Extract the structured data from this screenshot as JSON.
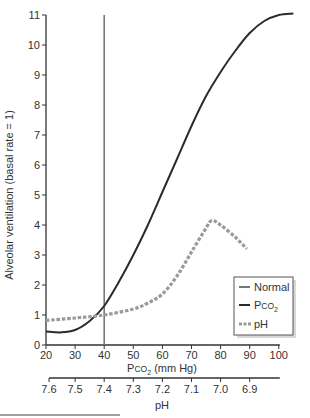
{
  "chart_data": {
    "type": "line",
    "title": "",
    "ylabel": "Alveolar ventilation (basal rate = 1)",
    "xlabel": "Pco2 (mm Hg)",
    "xlabel_parts": {
      "main": "P",
      "sub_small": "CO",
      "subscript": "2",
      "unit": " (mm Hg)"
    },
    "x2label": "pH",
    "xlim": [
      20,
      106
    ],
    "ylim": [
      0,
      11
    ],
    "x_ticks": [
      20,
      30,
      40,
      50,
      60,
      70,
      80,
      90,
      100
    ],
    "y_ticks": [
      0,
      1,
      2,
      3,
      4,
      5,
      6,
      7,
      8,
      9,
      10,
      11
    ],
    "ph_ticks": [
      {
        "label": "7.6",
        "x": 20
      },
      {
        "label": "7.5",
        "x": 30
      },
      {
        "label": "7.4",
        "x": 40
      },
      {
        "label": "7.3",
        "x": 50
      },
      {
        "label": "7.2",
        "x": 60
      },
      {
        "label": "7.1",
        "x": 70
      },
      {
        "label": "7.0",
        "x": 80
      },
      {
        "label": "6.9",
        "x": 90
      }
    ],
    "grid": false,
    "legend_position": "lower right",
    "series": [
      {
        "name": "Normal",
        "style": "vertical line",
        "color": "#777777",
        "x": 40
      },
      {
        "name": "Pco2",
        "style": "solid",
        "color": "#2b2b2b",
        "x": [
          20,
          25,
          30,
          35,
          40,
          45,
          50,
          55,
          60,
          65,
          70,
          75,
          80,
          85,
          90,
          95,
          100,
          105
        ],
        "y": [
          0.45,
          0.42,
          0.5,
          0.8,
          1.3,
          2.1,
          3.0,
          4.0,
          5.1,
          6.2,
          7.3,
          8.3,
          9.1,
          9.8,
          10.4,
          10.8,
          11.0,
          11.05
        ]
      },
      {
        "name": "pH",
        "style": "dashed",
        "color": "#9a9a9a",
        "x": [
          20,
          30,
          40,
          50,
          55,
          60,
          65,
          70,
          75,
          77,
          80,
          85,
          89
        ],
        "y": [
          0.82,
          0.9,
          1.0,
          1.2,
          1.4,
          1.7,
          2.3,
          3.1,
          3.9,
          4.15,
          4.0,
          3.6,
          3.2
        ]
      }
    ]
  },
  "legend": {
    "normal": "Normal",
    "pco2_main": "P",
    "pco2_sub": "CO",
    "pco2_subscript": "2",
    "ph": "pH"
  }
}
